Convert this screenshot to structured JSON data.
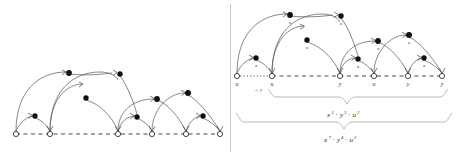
{
  "figure": {
    "panels": [
      {
        "id": "left-panel",
        "name": "left-derivation-diagram",
        "baseline_nodes": [
          {
            "x": 16,
            "y": 134,
            "label": ""
          },
          {
            "x": 50,
            "y": 134,
            "label": ""
          },
          {
            "x": 118,
            "y": 134,
            "label": ""
          },
          {
            "x": 152,
            "y": 134,
            "label": ""
          },
          {
            "x": 186,
            "y": 134,
            "label": ""
          },
          {
            "x": 220,
            "y": 134,
            "label": ""
          }
        ],
        "dots": [
          {
            "x": 35,
            "y": 116,
            "label": ""
          },
          {
            "x": 86,
            "y": 98,
            "label": ""
          },
          {
            "x": 69,
            "y": 73,
            "label": ""
          },
          {
            "x": 120,
            "y": 74,
            "label": ""
          },
          {
            "x": 137,
            "y": 117,
            "label": ""
          },
          {
            "x": 157,
            "y": 99,
            "label": ""
          },
          {
            "x": 203,
            "y": 116,
            "label": ""
          },
          {
            "x": 188,
            "y": 93,
            "label": ""
          }
        ]
      },
      {
        "id": "right-panel",
        "name": "right-derivation-diagram",
        "baseline_nodes": [
          {
            "x": 237,
            "y": 76,
            "label": "u"
          },
          {
            "x": 272,
            "y": 76,
            "label": "u"
          },
          {
            "x": 340,
            "y": 76,
            "label": "y"
          },
          {
            "x": 374,
            "y": 76,
            "label": "u"
          },
          {
            "x": 408,
            "y": 76,
            "label": "y"
          },
          {
            "x": 442,
            "y": 76,
            "label": "y"
          }
        ],
        "dots": [
          {
            "x": 256,
            "y": 58,
            "label": "x"
          },
          {
            "x": 307,
            "y": 40,
            "label": "x"
          },
          {
            "x": 290,
            "y": 15,
            "label": "x"
          },
          {
            "x": 341,
            "y": 16,
            "label": "x"
          },
          {
            "x": 358,
            "y": 59,
            "label": "x"
          },
          {
            "x": 378,
            "y": 41,
            "label": "x"
          },
          {
            "x": 424,
            "y": 58,
            "label": "x"
          },
          {
            "x": 409,
            "y": 35,
            "label": "x"
          }
        ],
        "annotations": [
          {
            "name": "maps-to-y-label",
            "x": 253,
            "y": 88,
            "text": "→ y"
          }
        ],
        "braces": [
          {
            "name": "upper-brace",
            "label_base": "x",
            "label_text": "x⁵ · y³ · u²",
            "parts": [
              {
                "sym": "x",
                "sup": "5"
              },
              {
                "sym": "y",
                "sup": "3"
              },
              {
                "sym": "u",
                "sup": "2"
              }
            ]
          },
          {
            "name": "lower-brace",
            "label_base": "x",
            "label_text": "x⁷ · y⁴ · u²",
            "parts": [
              {
                "sym": "x",
                "sup": "7"
              },
              {
                "sym": "y",
                "sup": "4"
              },
              {
                "sym": "u",
                "sup": "2"
              }
            ]
          }
        ]
      }
    ],
    "colors": {
      "stroke": "#555555",
      "node_fill": "#ffffff",
      "dot_fill": "#111111",
      "divider": "#bdbdbd",
      "brace": "#9a9a9a",
      "text": "#333333"
    }
  }
}
